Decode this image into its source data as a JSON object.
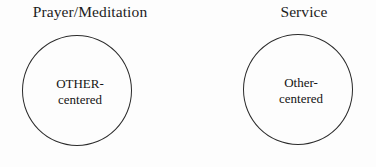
{
  "diagram": {
    "type": "two-circle-concept-diagram",
    "background_color": "#fdfdfd",
    "outline_color": "#2b2b2b",
    "text_color": "#1a1a1a",
    "panels": [
      {
        "title": "Prayer/Meditation",
        "circle": {
          "label_line1": "OTHER-",
          "label_line2": "centered"
        }
      },
      {
        "title": "Service",
        "circle": {
          "label_line1": "Other-",
          "label_line2": "centered"
        }
      }
    ]
  }
}
